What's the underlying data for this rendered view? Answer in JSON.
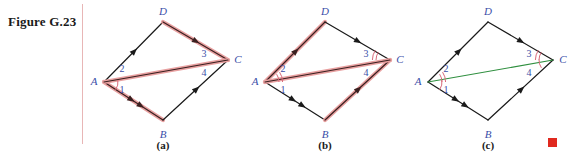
{
  "figure": {
    "caption": "Figure G.23"
  },
  "colors": {
    "background": "#ffffff",
    "rule": "#e8b6b6",
    "edge_plain": "#1a1a1a",
    "edge_highlight": "#e8a0a0",
    "edge_highlight_core": "#3a2020",
    "diagonal_green": "#2f8f3f",
    "label_blue": "#3a4ea8",
    "angle_arc": "#d86a7a",
    "qed": "#e0291f"
  },
  "panels": [
    {
      "id": "a",
      "label": "(a)",
      "label_x": 163,
      "label_y": 150,
      "vertices": {
        "A": {
          "name": "A",
          "x": 104,
          "y": 82,
          "lx": 94,
          "ly": 85
        },
        "B": {
          "name": "B",
          "x": 163,
          "y": 120,
          "lx": 163,
          "ly": 138
        },
        "C": {
          "name": "C",
          "x": 228,
          "y": 60,
          "lx": 238,
          "ly": 63
        },
        "D": {
          "name": "D",
          "x": 163,
          "y": 22,
          "lx": 163,
          "ly": 15
        }
      },
      "angles": [
        {
          "num": "1",
          "x": 122,
          "y": 93,
          "arcs": 1,
          "vertex": "A",
          "arc_r": 14,
          "a0": -8,
          "a1": 34
        },
        {
          "num": "2",
          "x": 122,
          "y": 72,
          "arcs": 0,
          "vertex": "A",
          "arc_r": 14,
          "a0": -34,
          "a1": 0
        },
        {
          "num": "3",
          "x": 204,
          "y": 57,
          "arcs": 0,
          "vertex": "C",
          "arc_r": 14,
          "a0": 146,
          "a1": 182
        },
        {
          "num": "4",
          "x": 204,
          "y": 76,
          "arcs": 0,
          "vertex": "C",
          "arc_r": 14,
          "a0": 180,
          "a1": 214
        }
      ],
      "edges": [
        {
          "from": "A",
          "to": "D",
          "highlight": false,
          "green": false,
          "arrows": 1
        },
        {
          "from": "D",
          "to": "C",
          "highlight": true,
          "green": false,
          "arrows": 1
        },
        {
          "from": "A",
          "to": "B",
          "highlight": true,
          "green": false,
          "arrows": 2
        },
        {
          "from": "B",
          "to": "C",
          "highlight": false,
          "green": false,
          "arrows": 1
        },
        {
          "from": "A",
          "to": "C",
          "highlight": true,
          "green": false,
          "arrows": 0
        }
      ]
    },
    {
      "id": "b",
      "label": "(b)",
      "label_x": 325,
      "label_y": 150,
      "vertices": {
        "A": {
          "name": "A",
          "x": 265,
          "y": 82,
          "lx": 255,
          "ly": 85
        },
        "B": {
          "name": "B",
          "x": 325,
          "y": 120,
          "lx": 325,
          "ly": 138
        },
        "C": {
          "name": "C",
          "x": 390,
          "y": 60,
          "lx": 400,
          "ly": 63
        },
        "D": {
          "name": "D",
          "x": 325,
          "y": 22,
          "lx": 325,
          "ly": 15
        }
      },
      "angles": [
        {
          "num": "1",
          "x": 283,
          "y": 93,
          "arcs": 0,
          "vertex": "A",
          "arc_r": 14,
          "a0": -8,
          "a1": 34
        },
        {
          "num": "2",
          "x": 283,
          "y": 72,
          "arcs": 2,
          "vertex": "A",
          "arc_r": 14,
          "a0": -34,
          "a1": 0
        },
        {
          "num": "3",
          "x": 366,
          "y": 57,
          "arcs": 0,
          "vertex": "C",
          "arc_r": 14,
          "a0": 146,
          "a1": 182
        },
        {
          "num": "4",
          "x": 366,
          "y": 76,
          "arcs": 2,
          "vertex": "C",
          "arc_r": 14,
          "a0": 180,
          "a1": 214
        }
      ],
      "edges": [
        {
          "from": "A",
          "to": "D",
          "highlight": true,
          "green": false,
          "arrows": 1
        },
        {
          "from": "D",
          "to": "C",
          "highlight": false,
          "green": false,
          "arrows": 1
        },
        {
          "from": "A",
          "to": "B",
          "highlight": false,
          "green": false,
          "arrows": 2
        },
        {
          "from": "B",
          "to": "C",
          "highlight": true,
          "green": false,
          "arrows": 1
        },
        {
          "from": "A",
          "to": "C",
          "highlight": true,
          "green": false,
          "arrows": 0
        }
      ]
    },
    {
      "id": "c",
      "label": "(c)",
      "label_x": 488,
      "label_y": 150,
      "vertices": {
        "A": {
          "name": "A",
          "x": 428,
          "y": 82,
          "lx": 418,
          "ly": 85
        },
        "B": {
          "name": "B",
          "x": 488,
          "y": 120,
          "lx": 488,
          "ly": 138
        },
        "C": {
          "name": "C",
          "x": 553,
          "y": 60,
          "lx": 563,
          "ly": 63
        },
        "D": {
          "name": "D",
          "x": 488,
          "y": 22,
          "lx": 488,
          "ly": 15
        }
      },
      "angles": [
        {
          "num": "1",
          "x": 446,
          "y": 93,
          "arcs": 1,
          "vertex": "A",
          "arc_r": 14,
          "a0": -8,
          "a1": 34
        },
        {
          "num": "2",
          "x": 446,
          "y": 72,
          "arcs": 2,
          "vertex": "A",
          "arc_r": 14,
          "a0": -34,
          "a1": 0
        },
        {
          "num": "3",
          "x": 529,
          "y": 57,
          "arcs": 1,
          "vertex": "C",
          "arc_r": 14,
          "a0": 146,
          "a1": 182
        },
        {
          "num": "4",
          "x": 529,
          "y": 76,
          "arcs": 2,
          "vertex": "C",
          "arc_r": 14,
          "a0": 180,
          "a1": 214
        }
      ],
      "edges": [
        {
          "from": "A",
          "to": "D",
          "highlight": false,
          "green": false,
          "arrows": 1
        },
        {
          "from": "D",
          "to": "C",
          "highlight": false,
          "green": false,
          "arrows": 1
        },
        {
          "from": "A",
          "to": "B",
          "highlight": false,
          "green": false,
          "arrows": 2
        },
        {
          "from": "B",
          "to": "C",
          "highlight": false,
          "green": false,
          "arrows": 1
        },
        {
          "from": "A",
          "to": "C",
          "highlight": false,
          "green": true,
          "arrows": 0
        }
      ]
    }
  ]
}
